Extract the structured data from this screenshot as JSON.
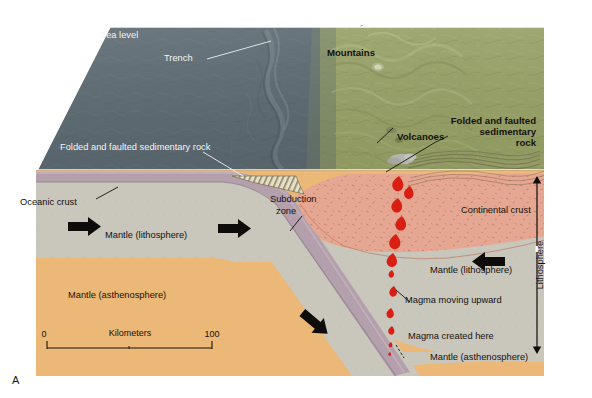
{
  "figure": {
    "panel_letter": "A",
    "width": 592,
    "height": 398,
    "background": "#ffffff"
  },
  "labels": {
    "sea_level": "Sea level",
    "trench": "Trench",
    "folded_sed_rock_ocean": "Folded and faulted sedimentary rock",
    "mountains": "Mountains",
    "volcanoes": "Volcanoes",
    "folded_sed_rock_land_line1": "Folded and faulted",
    "folded_sed_rock_land_line2": "sedimentary",
    "folded_sed_rock_land_line3": "rock",
    "oceanic_crust": "Oceanic crust",
    "subduction_zone_line1": "Subduction",
    "subduction_zone_line2": "zone",
    "continental_crust": "Continental crust",
    "mantle_lithosphere_left": "Mantle (lithosphere)",
    "mantle_lithosphere_right": "Mantle (lithosphere)",
    "mantle_asthenosphere_left": "Mantle (asthenosphere)",
    "mantle_asthenosphere_right": "Mantle (asthenosphere)",
    "magma_moving_upward": "Magma moving upward",
    "magma_created_here": "Magma created here",
    "lithosphere_bracket": "Lithosphere"
  },
  "scale_bar": {
    "min": "0",
    "max": "100",
    "units": "Kilometers"
  },
  "colors": {
    "ocean_surface": "#5d6a72",
    "land_surface": "#9aa468",
    "oceanic_crust": "#b3a0ac",
    "continental_crust": "#e5a791",
    "mantle_lithosphere": "#c9c6bc",
    "mantle_asthenosphere": "#ecb877",
    "magma": "#d81f12",
    "label_text": "#16120e",
    "label_text_light": "#f2f4f5",
    "page_background": "#ffffff"
  }
}
